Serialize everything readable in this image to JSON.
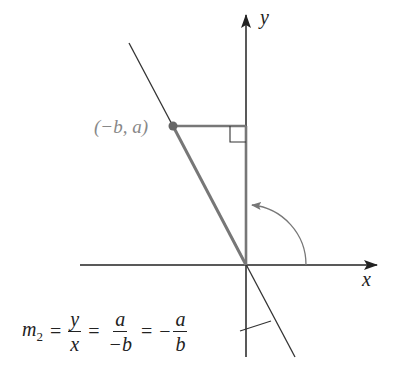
{
  "diagram": {
    "type": "coordinate-geometry",
    "axes": {
      "x_label": "x",
      "y_label": "y",
      "origin_px": [
        246,
        265
      ]
    },
    "point": {
      "label": "(−b, a)",
      "px": [
        173,
        126
      ],
      "color": "#777777"
    },
    "rotation_arc": {
      "description": "90° counterclockwise rotation arrow from positive x-axis toward y-axis"
    },
    "right_angle_marker": true,
    "formula": {
      "lhs": "m",
      "lhs_sub": "2",
      "eq": "=",
      "frac1": {
        "num": "y",
        "den": "x"
      },
      "frac2": {
        "num": "a",
        "den": "−b"
      },
      "neg": "−",
      "frac3": {
        "num": "a",
        "den": "b"
      }
    },
    "colors": {
      "line": "#333333",
      "highlight": "#777777"
    }
  }
}
